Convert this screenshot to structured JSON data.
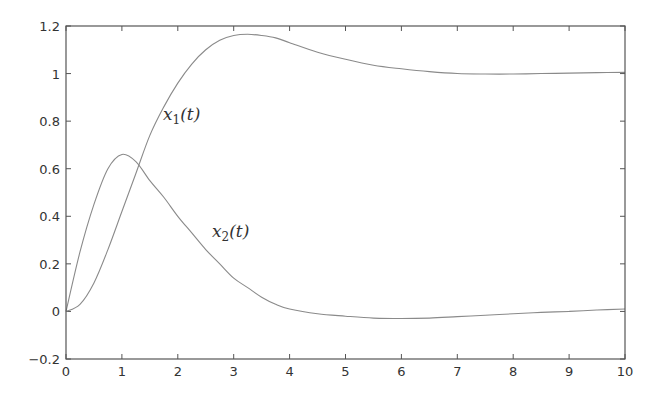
{
  "chart_data": {
    "type": "line",
    "title": "",
    "xlabel": "",
    "ylabel": "",
    "xlim": [
      0,
      10
    ],
    "ylim": [
      -0.2,
      1.2
    ],
    "grid": false,
    "legend": "none (inline curve labels)",
    "x_ticks": [
      "0",
      "1",
      "2",
      "3",
      "4",
      "5",
      "6",
      "7",
      "8",
      "9",
      "10"
    ],
    "y_ticks": [
      "-0.2",
      "0",
      "0.2",
      "0.4",
      "0.6",
      "0.8",
      "1",
      "1.2"
    ],
    "x": [
      0,
      0.25,
      0.5,
      0.75,
      1,
      1.25,
      1.5,
      1.75,
      2,
      2.25,
      2.5,
      2.75,
      3,
      3.25,
      3.5,
      3.75,
      4,
      4.5,
      5,
      5.5,
      6,
      6.5,
      7,
      7.5,
      8,
      8.5,
      9,
      9.5,
      10
    ],
    "series": [
      {
        "name": "x1(t)",
        "label": "x_1(t)",
        "color": "#8a8a8a",
        "values": [
          0,
          0.03,
          0.12,
          0.26,
          0.42,
          0.58,
          0.74,
          0.86,
          0.96,
          1.04,
          1.1,
          1.14,
          1.16,
          1.165,
          1.16,
          1.15,
          1.13,
          1.09,
          1.06,
          1.035,
          1.02,
          1.008,
          1.0,
          0.998,
          0.998,
          1.0,
          1.002,
          1.004,
          1.005
        ]
      },
      {
        "name": "x2(t)",
        "label": "x_2(t)",
        "color": "#8a8a8a",
        "values": [
          0,
          0.25,
          0.45,
          0.6,
          0.66,
          0.63,
          0.55,
          0.48,
          0.4,
          0.33,
          0.26,
          0.2,
          0.14,
          0.1,
          0.06,
          0.03,
          0.01,
          -0.01,
          -0.02,
          -0.028,
          -0.03,
          -0.028,
          -0.022,
          -0.016,
          -0.01,
          -0.004,
          0.0,
          0.006,
          0.01
        ]
      }
    ],
    "annotations": [
      {
        "text": "x1(t)",
        "x": 1.75,
        "y": 0.85
      },
      {
        "text": "x2(t)",
        "x": 2.6,
        "y": 0.35
      }
    ]
  },
  "labels": {
    "x1_main": "x",
    "x1_sub": "1",
    "x1_arg": "(t)",
    "x2_main": "x",
    "x2_sub": "2",
    "x2_arg": "(t)"
  }
}
